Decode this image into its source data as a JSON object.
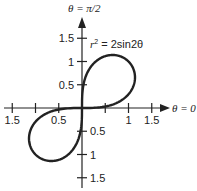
{
  "chart_data": {
    "type": "line",
    "title": "",
    "equation": "r² = 2sin2θ",
    "curve": "lemniscate r^2 = 2 sin(2θ), polar",
    "polar_axis_label": "θ = 0",
    "vertical_axis_label": "θ = π/2",
    "x_ticks": [
      -1.5,
      -1,
      -0.5,
      0.5,
      1,
      1.5
    ],
    "x_tick_labels": [
      {
        "value": -1.5,
        "label": "1.5"
      },
      {
        "value": -0.5,
        "label": "0.5"
      },
      {
        "value": 1,
        "label": "1"
      },
      {
        "value": 1.5,
        "label": "1.5"
      }
    ],
    "y_ticks": [
      -1.5,
      -1,
      -0.5,
      0.5,
      1,
      1.5
    ],
    "y_tick_labels": [
      {
        "value": 1.5,
        "label": "1.5"
      },
      {
        "value": 1,
        "label": "1"
      },
      {
        "value": 0.5,
        "label": "0.5"
      },
      {
        "value": -0.5,
        "label": "0.5"
      },
      {
        "value": -1,
        "label": "1"
      },
      {
        "value": -1.5,
        "label": "1.5"
      }
    ],
    "xlim": [
      -1.6,
      1.6
    ],
    "ylim": [
      -1.6,
      1.6
    ],
    "grid": false
  },
  "labels": {
    "top": "θ = π/2",
    "right": "θ = 0",
    "eq_r": "r",
    "eq_rest": " = 2sin2θ",
    "eq_exp": "2"
  }
}
